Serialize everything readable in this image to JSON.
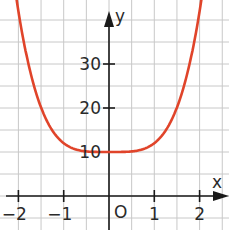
{
  "chart_data": {
    "type": "line",
    "title": "",
    "xlabel": "x",
    "ylabel": "y",
    "origin_label": "O",
    "function": "f(x) = 2x^4 + 10",
    "xlim": [
      -2.4,
      2.6
    ],
    "ylim": [
      -5,
      45
    ],
    "grid": true,
    "grid_step_x": 0.5,
    "grid_step_y": 5,
    "x_ticks": [
      -2,
      -1,
      1,
      2
    ],
    "x_tick_labels": [
      "−2",
      "−1",
      "1",
      "2"
    ],
    "y_ticks": [
      10,
      20,
      30
    ],
    "y_tick_labels": [
      "10",
      "20",
      "30"
    ],
    "series": [
      {
        "name": "f(x)",
        "color": "#E0442A",
        "x": [
          -2.05,
          -2.0,
          -1.75,
          -1.5,
          -1.25,
          -1.0,
          -0.75,
          -0.5,
          -0.25,
          0,
          0.25,
          0.5,
          0.75,
          1.0,
          1.25,
          1.5,
          1.75,
          2.0,
          2.05
        ],
        "y": [
          44.2,
          42.0,
          28.8,
          20.1,
          14.9,
          12.0,
          10.6,
          10.1,
          10.0,
          10.0,
          10.0,
          10.1,
          10.6,
          12.0,
          14.9,
          20.1,
          28.8,
          42.0,
          44.2
        ]
      }
    ],
    "minimum": {
      "x": 0,
      "y": 10
    },
    "colors": {
      "curve": "#E0442A",
      "axis": "#1a1a1a",
      "grid": "#c8c8c8",
      "text": "#2a2a2a"
    }
  }
}
